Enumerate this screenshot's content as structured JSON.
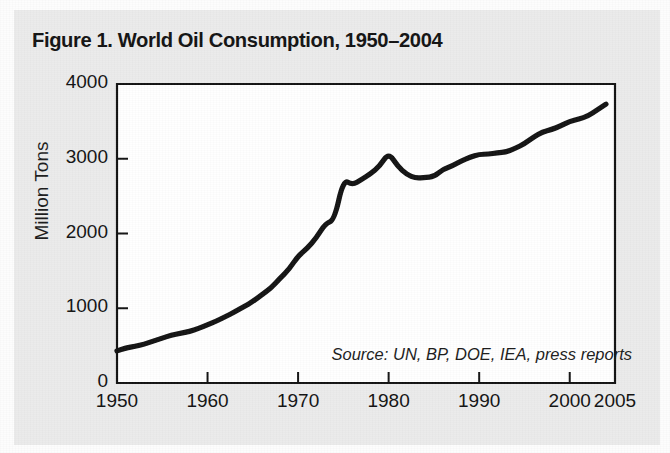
{
  "figure": {
    "title": "Figure 1. World Oil Consumption, 1950–2004",
    "source_note": "Source: UN, BP, DOE, IEA, press reports",
    "background_color": "#ebebeb",
    "plot_background_color": "#ffffff",
    "line_color": "#111111"
  },
  "chart_data": {
    "type": "line",
    "title": "Figure 1. World Oil Consumption, 1950–2004",
    "xlabel": "",
    "ylabel": "Million Tons",
    "xlim": [
      1950,
      2005
    ],
    "ylim": [
      0,
      4000
    ],
    "grid": false,
    "legend": "none",
    "xticks": [
      1950,
      1960,
      1970,
      1980,
      1990,
      2000,
      2005
    ],
    "xtick_labels": [
      "1950",
      "1960",
      "1970",
      "1980",
      "1990",
      "2000",
      "2005"
    ],
    "yticks": [
      0,
      1000,
      2000,
      3000,
      4000
    ],
    "ytick_labels": [
      "0",
      "1000",
      "2000",
      "3000",
      "4000"
    ],
    "annotations": [
      "Source: UN, BP, DOE, IEA, press reports"
    ],
    "series": [
      {
        "name": "World Oil Consumption",
        "units": "Million Tons",
        "x": [
          1950,
          1951,
          1952,
          1953,
          1954,
          1955,
          1956,
          1957,
          1958,
          1959,
          1960,
          1961,
          1962,
          1963,
          1964,
          1965,
          1966,
          1967,
          1968,
          1969,
          1970,
          1971,
          1972,
          1973,
          1974,
          1975,
          1976,
          1977,
          1978,
          1979,
          1980,
          1981,
          1982,
          1983,
          1984,
          1985,
          1986,
          1987,
          1988,
          1989,
          1990,
          1991,
          1992,
          1993,
          1994,
          1995,
          1996,
          1997,
          1998,
          1999,
          2000,
          2001,
          2002,
          2003,
          2004
        ],
        "values": [
          430,
          470,
          490,
          520,
          560,
          600,
          640,
          665,
          690,
          730,
          780,
          830,
          890,
          950,
          1020,
          1090,
          1180,
          1270,
          1400,
          1520,
          1700,
          1800,
          1940,
          2130,
          2180,
          2720,
          2650,
          2720,
          2800,
          2900,
          3080,
          2900,
          2790,
          2740,
          2750,
          2760,
          2860,
          2900,
          2970,
          3020,
          3060,
          3060,
          3080,
          3090,
          3140,
          3200,
          3290,
          3360,
          3390,
          3440,
          3500,
          3530,
          3570,
          3650,
          3730
        ]
      }
    ]
  },
  "axis": {
    "y_axis_title": "Million Tons"
  }
}
